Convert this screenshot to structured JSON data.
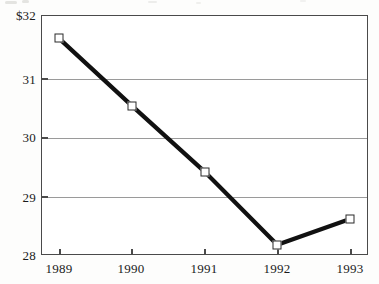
{
  "chart_data": {
    "type": "line",
    "title": "",
    "subtitle": "",
    "xlabel": "",
    "ylabel": "",
    "categories": [
      "1989",
      "1990",
      "1991",
      "1992",
      "1993"
    ],
    "values": [
      31.61,
      30.49,
      29.39,
      28.17,
      28.6
    ],
    "series": [
      {
        "name": "",
        "values": [
          31.61,
          30.49,
          29.39,
          28.17,
          28.6
        ]
      }
    ],
    "ylim": [
      28,
      32
    ],
    "yticks": [
      28,
      29,
      30,
      31,
      32
    ],
    "ytick_labels": [
      "28",
      "29",
      "30",
      "31",
      "$32"
    ],
    "xtick_labels": [
      "1989",
      "1990",
      "1991",
      "1992",
      "1993"
    ],
    "grid": "horizontal",
    "legend": "none",
    "marker": "open-square",
    "line_color": "#111111",
    "marker_face_color": "#ffffff",
    "marker_edge_color": "#2a2a2a",
    "grid_color": "#9a9a9a",
    "axis_color": "#4a4a4a",
    "background_color": "#ffffff",
    "currency_symbol": "$"
  },
  "axis": {
    "y": {
      "labels": [
        {
          "text": "$32",
          "value": 32
        },
        {
          "text": "31",
          "value": 31
        },
        {
          "text": "30",
          "value": 30
        },
        {
          "text": "29",
          "value": 29
        },
        {
          "text": "28",
          "value": 28
        }
      ]
    },
    "x": {
      "labels": [
        {
          "text": "1989"
        },
        {
          "text": "1990"
        },
        {
          "text": "1991"
        },
        {
          "text": "1992"
        },
        {
          "text": "1993"
        }
      ]
    }
  }
}
